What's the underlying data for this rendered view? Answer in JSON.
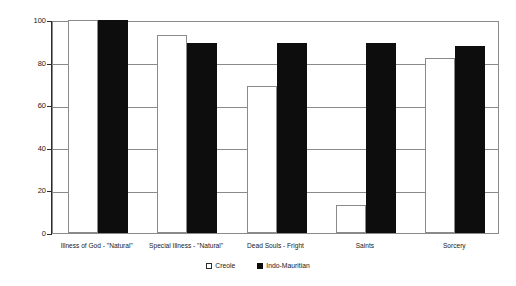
{
  "chart_data": {
    "type": "bar",
    "title": "",
    "xlabel": "",
    "ylabel": "% OF ETHNIC GROUP",
    "ylim": [
      0,
      100
    ],
    "yticks": [
      0,
      20,
      40,
      60,
      80,
      100
    ],
    "grid": true,
    "legend_position": "bottom-center",
    "categories": [
      "Illness of God - \"Natural\"",
      "Special Illness - \"Natural\"",
      "Dead Souls - Fright",
      "Saints",
      "Sorcery"
    ],
    "series": [
      {
        "name": "Creole",
        "color": "#ffffff",
        "values": [
          100,
          93,
          69,
          13,
          82
        ]
      },
      {
        "name": "Indo-Mauritian",
        "color": "#0d0d0d",
        "values": [
          100,
          89,
          89,
          89,
          88
        ]
      }
    ]
  },
  "legend": {
    "items": [
      {
        "label": "Creole",
        "swatch": "white-square-swatch"
      },
      {
        "label": "Indo-Mauritian",
        "swatch": "black-square-swatch"
      }
    ]
  }
}
